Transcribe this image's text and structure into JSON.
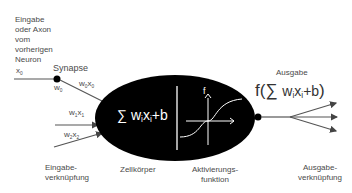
{
  "labels": {
    "input_source": [
      "Eingabe",
      "oder Axon",
      "vom",
      "vorherigen",
      "Neuron"
    ],
    "synapse": "Synapse",
    "input_junction": [
      "Eingabe-",
      "verknüpfung"
    ],
    "cell_body": "Zellkörper",
    "activation_function": [
      "Aktivierungs-",
      "funktion"
    ],
    "output": "Ausgabe",
    "output_junction": [
      "Ausgabe-",
      "verknüpfung"
    ]
  },
  "inputs": [
    {
      "x": "x",
      "x_sub": "0",
      "w": "w",
      "w_sub": "0",
      "wx": "w",
      "wx_sub1": "0",
      "wx_x": "x",
      "wx_sub2": "0"
    },
    {
      "wx": "w",
      "wx_sub1": "1",
      "wx_x": "x",
      "wx_sub2": "1"
    },
    {
      "wx": "w",
      "wx_sub1": "2",
      "wx_x": "x",
      "wx_sub2": "2"
    }
  ],
  "cell": {
    "sum_symbol": "∑",
    "sum_expr_w": "w",
    "sum_expr_x": "x",
    "sub_i": "i",
    "bias": "+b",
    "activation_label": "f"
  },
  "output_formula": {
    "f": "f(",
    "sum_symbol": "∑",
    "w": "w",
    "x": "x",
    "sub_i": "i",
    "bias": "+b",
    "close": ")"
  },
  "colors": {
    "cell_fill": "#000000",
    "line": "#444444",
    "text": "#4a4a4a"
  }
}
